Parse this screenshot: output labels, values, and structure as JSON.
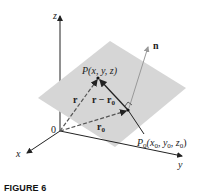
{
  "figure": {
    "caption": "FIGURE 6",
    "axes": {
      "x": "x",
      "y": "y",
      "z": "z",
      "origin": "0"
    },
    "labels": {
      "P": "P(x, y, z)",
      "P0": "P",
      "P0_sub": "0",
      "P0_args": "(x",
      "P0_args_sub1": "0",
      "P0_args_mid1": ", y",
      "P0_args_sub2": "0",
      "P0_args_mid2": ", z",
      "P0_args_sub3": "0",
      "P0_args_end": ")",
      "n": "n",
      "r": "r",
      "r_minus_r0": "r − r",
      "r_minus_r0_sub": "0",
      "r0": "r",
      "r0_sub": "0"
    },
    "colors": {
      "plane": "#d6d6d6",
      "line": "#222222",
      "normal": "#999999"
    }
  }
}
